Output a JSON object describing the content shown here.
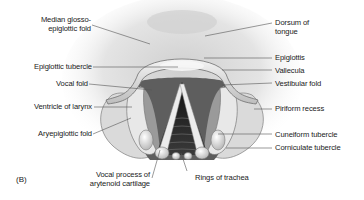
{
  "figure": {
    "panel_label": "(B)"
  },
  "labels": {
    "left": [
      {
        "id": "median-glosso-epiglottic-fold",
        "lines": [
          "Median glosso-",
          "epiglottic fold"
        ]
      },
      {
        "id": "epiglottic-tubercle",
        "lines": [
          "Epiglottic tubercle"
        ]
      },
      {
        "id": "vocal-fold",
        "lines": [
          "Vocal fold"
        ]
      },
      {
        "id": "ventricle-of-larynx",
        "lines": [
          "Ventricle of larynx"
        ]
      },
      {
        "id": "aryepiglottic-fold",
        "lines": [
          "Aryepiglottic fold"
        ]
      }
    ],
    "right": [
      {
        "id": "dorsum-of-tongue",
        "lines": [
          "Dorsum of",
          "tongue"
        ]
      },
      {
        "id": "epiglottis",
        "lines": [
          "Epiglottis"
        ]
      },
      {
        "id": "vallecula",
        "lines": [
          "Vallecula"
        ]
      },
      {
        "id": "vestibular-fold",
        "lines": [
          "Vestibular fold"
        ]
      },
      {
        "id": "piriform-recess",
        "lines": [
          "Piriform recess"
        ]
      },
      {
        "id": "cuneiform-tubercle",
        "lines": [
          "Cuneiform tubercle"
        ]
      },
      {
        "id": "corniculate-tubercle",
        "lines": [
          "Corniculate tubercle"
        ]
      }
    ],
    "bottom": [
      {
        "id": "vocal-process",
        "lines": [
          "Vocal process of",
          "arytenoid cartilage"
        ]
      },
      {
        "id": "rings-of-trachea",
        "lines": [
          "Rings of trachea"
        ]
      }
    ]
  },
  "colors": {
    "text": "#1a1a1a",
    "leader_line": "#555555",
    "tissue_light": "#e6e6e6",
    "tissue_mid": "#bdbdbd",
    "tissue_dark": "#6e6e6e",
    "airway": "#1e1e1e"
  }
}
